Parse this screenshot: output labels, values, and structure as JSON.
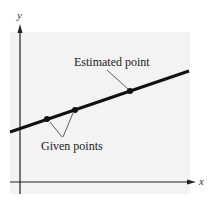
{
  "diagram": {
    "axes": {
      "x_label": "x",
      "y_label": "y"
    },
    "annotations": {
      "estimated": "Estimated point",
      "given": "Given points"
    },
    "colors": {
      "line": "#111111",
      "panel": "#f3f3f3",
      "axis": "#222222"
    },
    "points": [
      {
        "role": "given",
        "x": 47,
        "y": 119
      },
      {
        "role": "given",
        "x": 75,
        "y": 110
      },
      {
        "role": "estimated",
        "x": 130,
        "y": 91
      }
    ]
  }
}
